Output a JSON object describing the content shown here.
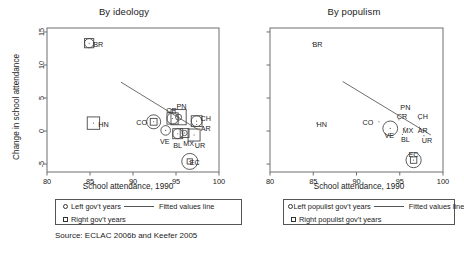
{
  "figure": {
    "source_note": "Source: ECLAC 2006b and Keefer 2005",
    "axis_x_title": "School attendance, 1990",
    "axis_y_title": "Change in school attendance",
    "xlim": [
      80,
      100
    ],
    "ylim": [
      -6.2,
      15.6
    ],
    "xticks": [
      80,
      85,
      90,
      95,
      100
    ],
    "yticks": [
      -5,
      0,
      5,
      10,
      15
    ]
  },
  "panels": [
    {
      "id": "left",
      "title": "By ideology",
      "axis_x_title": "School attendance, 1990",
      "axis_y_title": "Change in school attendance",
      "legend": {
        "rows": [
          {
            "symbol": "circle",
            "label": "Left gov't years",
            "line_label": "Fitted values line"
          },
          {
            "symbol": "square",
            "label": "Right gov't years",
            "line_label": ""
          }
        ]
      }
    },
    {
      "id": "right",
      "title": "By populism",
      "axis_x_title": "School attendance, 1990",
      "axis_y_title": "",
      "legend": {
        "rows": [
          {
            "symbol": "circle",
            "label": "Left populist gov't years",
            "line_label": "Fitted values line"
          },
          {
            "symbol": "square",
            "label": "Right populist gov't years",
            "line_label": ""
          }
        ]
      }
    }
  ],
  "chart_data": [
    {
      "type": "scatter",
      "panel": "left",
      "title": "By ideology",
      "xlabel": "School attendance, 1990",
      "ylabel": "Change in school attendance",
      "xlim": [
        80,
        100
      ],
      "ylim": [
        -6.2,
        15.6
      ],
      "xticks": [
        80,
        85,
        90,
        95,
        100
      ],
      "yticks": [
        -5,
        0,
        5,
        10,
        15
      ],
      "grid": false,
      "legend_position": "below-axis",
      "note": "Bubble size of the circle encodes left gov't years; bubble size of the square encodes right gov't years.",
      "points": [
        {
          "label": "BR",
          "x": 84.9,
          "y": 13.3,
          "circle_r": 4.6,
          "square_s": 4.6,
          "label_dx": 9,
          "label_dy": 1
        },
        {
          "label": "HN",
          "x": 85.4,
          "y": 1.2,
          "circle_r": 0.0,
          "square_s": 6.2,
          "label_dx": 10,
          "label_dy": 1
        },
        {
          "label": "CO",
          "x": 92.4,
          "y": 1.4,
          "circle_r": 7.0,
          "square_s": 3.4,
          "label_dx": -12,
          "label_dy": 1
        },
        {
          "label": "VE",
          "x": 93.8,
          "y": 0.1,
          "circle_r": 4.8,
          "square_s": 0.0,
          "label_dx": -1,
          "label_dy": 11
        },
        {
          "label": "CR",
          "x": 94.6,
          "y": 1.9,
          "circle_r": 5.6,
          "square_s": 5.6,
          "label_dx": -1,
          "label_dy": -8
        },
        {
          "label": "PN",
          "x": 95.3,
          "y": 2.1,
          "circle_r": 3.0,
          "square_s": 7.6,
          "label_dx": 3,
          "label_dy": -11
        },
        {
          "label": "BL",
          "x": 95.2,
          "y": -0.4,
          "circle_r": 5.0,
          "square_s": 5.0,
          "label_dx": 0,
          "label_dy": 12
        },
        {
          "label": "MX",
          "x": 96.0,
          "y": -0.3,
          "circle_r": 2.6,
          "square_s": 4.4,
          "label_dx": 4,
          "label_dy": 10
        },
        {
          "label": "CH",
          "x": 97.4,
          "y": 1.5,
          "circle_r": 5.4,
          "square_s": 5.4,
          "label_dx": 9,
          "label_dy": -3
        },
        {
          "label": "AR",
          "x": 97.4,
          "y": 1.0,
          "circle_r": 0.0,
          "square_s": 0.0,
          "label_dx": 9,
          "label_dy": 4
        },
        {
          "label": "UR",
          "x": 97.1,
          "y": -0.6,
          "circle_r": 0.0,
          "square_s": 6.0,
          "label_dx": 6,
          "label_dy": 10
        },
        {
          "label": "EC",
          "x": 96.6,
          "y": -4.6,
          "circle_r": 8.0,
          "square_s": 2.6,
          "label_dx": 5,
          "label_dy": 1
        }
      ],
      "fitted_line": {
        "x1": 88.6,
        "y1": 7.4,
        "x2": 97.6,
        "y2": 0.2
      }
    },
    {
      "type": "scatter",
      "panel": "right",
      "title": "By populism",
      "xlabel": "School attendance, 1990",
      "ylabel": "",
      "xlim": [
        80,
        100
      ],
      "ylim": [
        -6.2,
        15.6
      ],
      "xticks": [
        80,
        85,
        90,
        95,
        100
      ],
      "yticks": [
        -5,
        0,
        5,
        10,
        15
      ],
      "grid": false,
      "legend_position": "below-axis",
      "note": "Bubble size of the circle encodes left populist gov't years; bubble size of the square encodes right populist gov't years.",
      "points": [
        {
          "label": "BR",
          "x": 84.9,
          "y": 13.3,
          "circle_r": 0.0,
          "square_s": 0.0,
          "label_dx": 5,
          "label_dy": 1
        },
        {
          "label": "HN",
          "x": 85.4,
          "y": 1.2,
          "circle_r": 0.0,
          "square_s": 0.0,
          "label_dx": 5,
          "label_dy": 1
        },
        {
          "label": "CO",
          "x": 92.6,
          "y": 1.4,
          "circle_r": 0.0,
          "square_s": 0.0,
          "label_dx": -11,
          "label_dy": 1
        },
        {
          "label": "VE",
          "x": 93.9,
          "y": 0.4,
          "circle_r": 7.4,
          "square_s": 0.0,
          "label_dx": -1,
          "label_dy": 7
        },
        {
          "label": "CR",
          "x": 94.9,
          "y": 1.7,
          "circle_r": 0.0,
          "square_s": 0.0,
          "label_dx": 3,
          "label_dy": -3
        },
        {
          "label": "PN",
          "x": 95.3,
          "y": 2.5,
          "circle_r": 0.0,
          "square_s": 0.0,
          "label_dx": 3,
          "label_dy": -7
        },
        {
          "label": "BL",
          "x": 95.3,
          "y": -0.5,
          "circle_r": 0.0,
          "square_s": 0.0,
          "label_dx": 3,
          "label_dy": 5
        },
        {
          "label": "MX",
          "x": 95.6,
          "y": 0.5,
          "circle_r": 0.0,
          "square_s": 0.0,
          "label_dx": 3,
          "label_dy": 3
        },
        {
          "label": "CH",
          "x": 97.3,
          "y": 1.7,
          "circle_r": 0.0,
          "square_s": 0.0,
          "label_dx": 3,
          "label_dy": -3
        },
        {
          "label": "AR",
          "x": 97.3,
          "y": 0.6,
          "circle_r": 0.0,
          "square_s": 0.0,
          "label_dx": 3,
          "label_dy": 3
        },
        {
          "label": "UR",
          "x": 97.8,
          "y": -0.7,
          "circle_r": 0.0,
          "square_s": 0.0,
          "label_dx": 3,
          "label_dy": 5
        },
        {
          "label": "EC",
          "x": 96.6,
          "y": -4.4,
          "circle_r": 7.6,
          "square_s": 3.2,
          "label_dx": 0,
          "label_dy": -6
        }
      ],
      "fitted_line": {
        "x1": 88.4,
        "y1": 7.5,
        "x2": 98.6,
        "y2": -0.6
      }
    }
  ]
}
